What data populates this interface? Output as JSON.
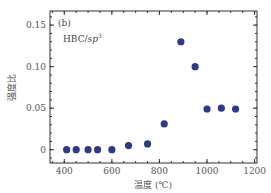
{
  "chart_data": {
    "type": "scatter",
    "title": "",
    "panel_label": "(b)",
    "annotation": {
      "main": "HBC/",
      "italic": "sp",
      "sup": "3"
    },
    "xlabel": "温度 (℃)",
    "ylabel": "强度比",
    "xlim": [
      340,
      1210
    ],
    "ylim": [
      -0.016,
      0.167
    ],
    "xticks": [
      400,
      600,
      800,
      1000,
      1200
    ],
    "xtick_labels": [
      "400",
      "600",
      "800",
      "1000",
      "1200"
    ],
    "yticks": [
      0,
      0.05,
      0.1,
      0.15
    ],
    "ytick_labels": [
      "0",
      "0.05",
      "0.10",
      "0.15"
    ],
    "grid": false,
    "legend": null,
    "marker_color": "#2e3a87",
    "series": [
      {
        "name": "HBC/sp3",
        "x": [
          410,
          450,
          500,
          540,
          600,
          670,
          750,
          820,
          890,
          950,
          1000,
          1060,
          1120
        ],
        "y": [
          0,
          0,
          0,
          0,
          0,
          0.005,
          0.007,
          0.031,
          0.13,
          0.1,
          0.049,
          0.05,
          0.049
        ]
      }
    ]
  }
}
